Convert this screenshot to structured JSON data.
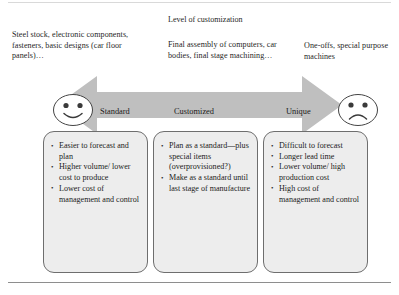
{
  "figure": {
    "heading": "Level of customization",
    "callouts": {
      "left": "Steel stock, electronic components, fasteners, basic designs (car floor panels)…",
      "middle": "Final assembly of computers, car bodies, final stage machining…",
      "right": "One-offs, special purpose machines"
    },
    "spectrum": {
      "labels": {
        "standard": "Standard",
        "customized": "Customized",
        "unique": "Unique"
      },
      "faces": {
        "left": "happy-face",
        "right": "sad-face"
      },
      "arrow": "double-headed-arrow"
    },
    "columns": [
      {
        "key": "standard",
        "bullets": [
          "Easier to forecast and plan",
          "Higher volume/ lower cost to produce",
          "Lower cost of management and control"
        ]
      },
      {
        "key": "customized",
        "bullets": [
          "Plan as a standard—plus special items (overprovisioned?)",
          "Make as a standard until last stage of manufacture"
        ]
      },
      {
        "key": "unique",
        "bullets": [
          "Difficult to forecast",
          "Longer lead time",
          "Lower volume/ high production cost",
          "High cost of management and control"
        ]
      }
    ],
    "colors": {
      "arrow_fill": "#bfbfbf",
      "box_fill": "#ededed",
      "box_border": "#6e6e6e",
      "text": "#1c1c1c"
    }
  }
}
